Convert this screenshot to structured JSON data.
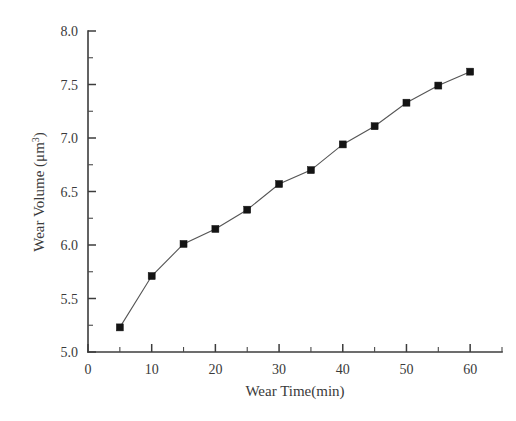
{
  "chart_data": {
    "type": "line",
    "title": "",
    "xlabel": "Wear Time(min)",
    "ylabel": "Wear Volume (μm",
    "ylabel_sup": "3",
    "ylabel_tail": ")",
    "x": [
      5,
      10,
      15,
      20,
      25,
      30,
      35,
      40,
      45,
      50,
      55,
      60
    ],
    "values": [
      5.23,
      5.71,
      6.01,
      6.15,
      6.33,
      6.57,
      6.7,
      6.94,
      7.11,
      7.33,
      7.49,
      7.62
    ],
    "series": [
      {
        "name": "Wear Volume",
        "values": [
          5.23,
          5.71,
          6.01,
          6.15,
          6.33,
          6.57,
          6.7,
          6.94,
          7.11,
          7.33,
          7.49,
          7.62
        ]
      }
    ],
    "xlim": [
      0,
      65
    ],
    "ylim": [
      5.0,
      8.0
    ],
    "xticks": [
      0,
      10,
      20,
      30,
      40,
      50,
      60
    ],
    "xtick_labels": [
      "0",
      "10",
      "20",
      "30",
      "40",
      "50",
      "60"
    ],
    "xminor_step": 5,
    "yticks": [
      5.0,
      5.5,
      6.0,
      6.5,
      7.0,
      7.5,
      8.0
    ],
    "ytick_labels": [
      "5.0",
      "5.5",
      "6.0",
      "6.5",
      "7.0",
      "7.5",
      "8.0"
    ],
    "yminor_step": 0.25,
    "grid": false,
    "legend": "none",
    "marker": "filled-square",
    "marker_color": "#141414",
    "line_color": "#555555",
    "axis_color": "#3c3c3c",
    "background": "#ffffff"
  }
}
